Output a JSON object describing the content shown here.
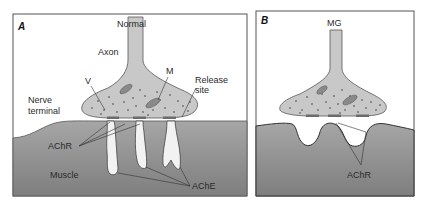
{
  "figure": {
    "panels": [
      {
        "id": "A",
        "letter": "A",
        "title": "Normal",
        "labels": {
          "axon": "Axon",
          "vesicle": "V",
          "mitochondrion": "M",
          "release_site_1": "Release",
          "release_site_2": "site",
          "nerve_terminal_1": "Nerve",
          "nerve_terminal_2": "terminal",
          "achr": "AChR",
          "muscle": "Muscle",
          "ache": "AChE"
        }
      },
      {
        "id": "B",
        "letter": "B",
        "title": "MG",
        "labels": {
          "achr": "AChR"
        }
      }
    ],
    "colors": {
      "terminal_fill": "#c8c8c8",
      "muscle_fill": "#8a8a8a",
      "outline": "#4a4a4a",
      "background": "#ffffff",
      "release_site": "#6b6b6b"
    }
  }
}
